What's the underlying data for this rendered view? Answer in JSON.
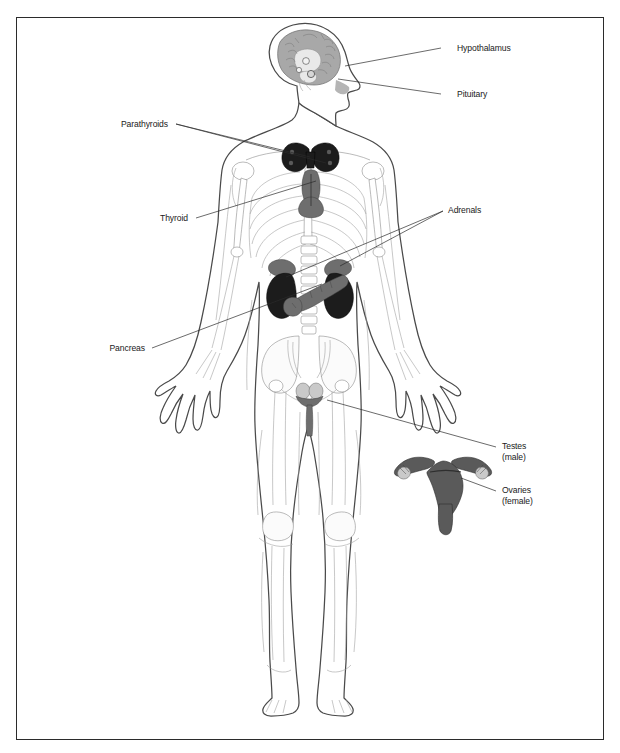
{
  "diagram": {
    "border_color": "#2b2b2b",
    "background": "#ffffff"
  },
  "labels": [
    {
      "id": "hypothalamus",
      "text": "Hypothalamus",
      "sub": "",
      "x": 457,
      "y": 51,
      "anchor": "start",
      "leader": "M 441 48 L 345 66"
    },
    {
      "id": "pituitary",
      "text": "Pituitary",
      "sub": "",
      "x": 457,
      "y": 97,
      "anchor": "start",
      "leader": "M 441 94 L 338 79"
    },
    {
      "id": "parathyroids",
      "text": "Parathyroids",
      "sub": "",
      "x": 168,
      "y": 127,
      "anchor": "end",
      "leader": "M 176 124 L 310 157"
    },
    {
      "id": "thyroid",
      "text": "Thyroid",
      "sub": "",
      "x": 188,
      "y": 221,
      "anchor": "end",
      "leader": "M 196 218 L 316 181"
    },
    {
      "id": "adrenals",
      "text": "Adrenals",
      "sub": "",
      "x": 448,
      "y": 213,
      "anchor": "start",
      "leader": "M 443 211 L 286 277"
    },
    {
      "id": "pancreas",
      "text": "Pancreas",
      "sub": "",
      "x": 145,
      "y": 351,
      "anchor": "end",
      "leader": "M 152 348 L 322 284"
    },
    {
      "id": "testes",
      "text": "Testes",
      "sub": "(male)",
      "x": 502,
      "y": 449,
      "anchor": "start",
      "leader": "M 496 447 L 327 400"
    },
    {
      "id": "ovaries",
      "text": "Ovaries",
      "sub": "(female)",
      "x": 502,
      "y": 493,
      "anchor": "start",
      "leader": "M 496 491 L 461 478"
    }
  ],
  "organs": [
    {
      "id": "brain",
      "label": "brain",
      "color": "#a8a8a8"
    },
    {
      "id": "hypothalamus-marker",
      "label": "hypothalamus",
      "color": "#e9e9e9"
    },
    {
      "id": "pituitary-marker",
      "label": "pituitary",
      "color": "#e9e9e9"
    },
    {
      "id": "thyroid-gland",
      "label": "thyroid",
      "color": "#6e6e6e"
    },
    {
      "id": "parathyroid-glands",
      "label": "parathyroids",
      "color": "#1c1c1c"
    },
    {
      "id": "adrenal-left",
      "label": "adrenal gland left",
      "color": "#6e6e6e"
    },
    {
      "id": "adrenal-right",
      "label": "adrenal gland right",
      "color": "#6e6e6e"
    },
    {
      "id": "kidney-left",
      "label": "kidney left",
      "color": "#1c1c1c"
    },
    {
      "id": "kidney-right",
      "label": "kidney right",
      "color": "#1c1c1c"
    },
    {
      "id": "pancreas-organ",
      "label": "pancreas",
      "color": "#6e6e6e"
    },
    {
      "id": "testes-organ",
      "label": "testes",
      "color": "#c9c9c9"
    },
    {
      "id": "uterus-organ",
      "label": "uterus",
      "color": "#5a5a5a"
    },
    {
      "id": "ovary-left",
      "label": "ovary left",
      "color": "#c9c9c9"
    },
    {
      "id": "ovary-right",
      "label": "ovary right",
      "color": "#c9c9c9"
    }
  ]
}
